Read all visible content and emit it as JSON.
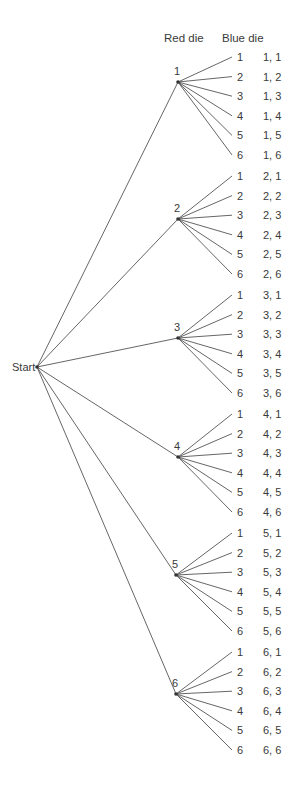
{
  "diagram": {
    "type": "tree",
    "headers": {
      "red": "Red die",
      "blue": "Blue die"
    },
    "root": {
      "label": "Start",
      "x": 37,
      "y": 367
    },
    "line_color": "#555555",
    "nodes": [
      {
        "label": "1",
        "x": 178,
        "y": 82,
        "leaf_y0": 57
      },
      {
        "label": "2",
        "x": 178,
        "y": 219,
        "leaf_y0": 176
      },
      {
        "label": "3",
        "x": 178,
        "y": 338,
        "leaf_y0": 295
      },
      {
        "label": "4",
        "x": 178,
        "y": 457,
        "leaf_y0": 414
      },
      {
        "label": "5",
        "x": 176,
        "y": 575,
        "leaf_y0": 533
      },
      {
        "label": "6",
        "x": 176,
        "y": 694,
        "leaf_y0": 652
      }
    ],
    "blue_values": [
      "1",
      "2",
      "3",
      "4",
      "5",
      "6"
    ],
    "leaf_spacing": 19.6,
    "leaf_x": 232,
    "outcomes": [
      [
        "1, 1",
        "1, 2",
        "1, 3",
        "1, 4",
        "1, 5",
        "1, 6"
      ],
      [
        "2, 1",
        "2, 2",
        "2, 3",
        "2, 4",
        "2, 5",
        "2, 6"
      ],
      [
        "3, 1",
        "3, 2",
        "3, 3",
        "3, 4",
        "3, 5",
        "3, 6"
      ],
      [
        "4, 1",
        "4, 2",
        "4, 3",
        "4, 4",
        "4, 5",
        "4, 6"
      ],
      [
        "5, 1",
        "5, 2",
        "5, 3",
        "5, 4",
        "5, 5",
        "5, 6"
      ],
      [
        "6, 1",
        "6, 2",
        "6, 3",
        "6, 4",
        "6, 5",
        "6, 6"
      ]
    ]
  }
}
